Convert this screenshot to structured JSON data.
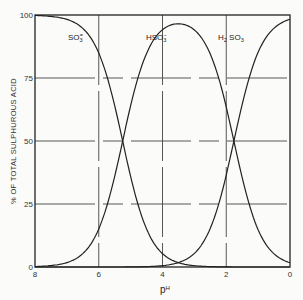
{
  "chart_data": {
    "type": "line",
    "title": "",
    "xlabel": "pH",
    "ylabel": "% OF TOTAL SULPHUROUS ACID",
    "xlim": [
      8,
      0
    ],
    "ylim": [
      0,
      100
    ],
    "x_reversed": true,
    "xticks": [
      "8",
      "6",
      "4",
      "2",
      "0"
    ],
    "yticks": [
      "0",
      "25",
      "50",
      "75",
      "100"
    ],
    "grid": true,
    "legend": "inline labels on curves",
    "x": [
      8,
      7.5,
      7,
      6.5,
      6,
      5.5,
      5,
      4.5,
      4,
      3.5,
      3,
      2.5,
      2,
      1.5,
      1,
      0.5,
      0
    ],
    "series": [
      {
        "name": "SO3=",
        "label_main": "SO",
        "label_sub": "3",
        "label_sup": "=",
        "values": [
          99.8,
          99.4,
          98.3,
          94.7,
          84.9,
          64.0,
          36.0,
          15.0,
          5.3,
          1.7,
          0.5,
          0.1,
          0,
          0,
          0,
          0,
          0
        ]
      },
      {
        "name": "HSO3-",
        "label_main": "HSO",
        "label_sub": "3",
        "label_sup": "−",
        "values": [
          0.2,
          0.6,
          1.7,
          5.3,
          15.1,
          36.0,
          64.0,
          84.7,
          94.1,
          96.5,
          94.1,
          84.5,
          63.5,
          35.5,
          14.8,
          5.2,
          1.7
        ]
      },
      {
        "name": "H2SO3",
        "label_main": "H",
        "label_sub": "2",
        "label_main2": " SO",
        "label_sub2": "3",
        "values": [
          0,
          0,
          0,
          0,
          0,
          0,
          0,
          0.2,
          0.6,
          1.8,
          5.4,
          15.4,
          36.5,
          64.5,
          85.2,
          94.8,
          98.3
        ]
      }
    ],
    "colors": {
      "line": "#222222",
      "grid": "#333333",
      "background": "#fbfbfa"
    }
  }
}
